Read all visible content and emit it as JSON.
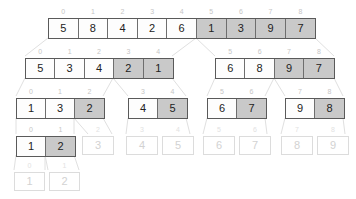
{
  "visualization": {
    "title": "merge-sort-recursion-tree",
    "colors": {
      "shaded_cell": "#c9c9c9",
      "plain_cell": "#fbfbfb",
      "border": "#5a5a5a",
      "faded_text": "#d2d2d2",
      "index_label": "#c6c6c6",
      "connector": "#e0e0e0"
    },
    "rows": [
      {
        "name": "level-0",
        "top": 18,
        "groups": [
          {
            "name": "group-0-8",
            "left": 48,
            "cell_width": 29.6,
            "faded": false,
            "cells": [
              {
                "index": "0",
                "value": "5",
                "shaded": false
              },
              {
                "index": "1",
                "value": "8",
                "shaded": false
              },
              {
                "index": "2",
                "value": "4",
                "shaded": false
              },
              {
                "index": "3",
                "value": "2",
                "shaded": false
              },
              {
                "index": "4",
                "value": "6",
                "shaded": false
              },
              {
                "index": "5",
                "value": "1",
                "shaded": true
              },
              {
                "index": "6",
                "value": "3",
                "shaded": true
              },
              {
                "index": "7",
                "value": "9",
                "shaded": true
              },
              {
                "index": "8",
                "value": "7",
                "shaded": true
              }
            ]
          }
        ]
      },
      {
        "name": "level-1",
        "top": 58,
        "groups": [
          {
            "name": "group-0-4",
            "left": 25,
            "cell_width": 29.4,
            "faded": false,
            "cells": [
              {
                "index": "0",
                "value": "5",
                "shaded": false
              },
              {
                "index": "1",
                "value": "3",
                "shaded": false
              },
              {
                "index": "2",
                "value": "4",
                "shaded": false
              },
              {
                "index": "3",
                "value": "2",
                "shaded": true
              },
              {
                "index": "4",
                "value": "1",
                "shaded": true
              }
            ]
          },
          {
            "name": "group-5-8",
            "left": 215,
            "cell_width": 29.4,
            "faded": false,
            "cells": [
              {
                "index": "5",
                "value": "6",
                "shaded": false
              },
              {
                "index": "6",
                "value": "8",
                "shaded": false
              },
              {
                "index": "7",
                "value": "9",
                "shaded": true
              },
              {
                "index": "8",
                "value": "7",
                "shaded": true
              }
            ]
          }
        ]
      },
      {
        "name": "level-2",
        "top": 98,
        "groups": [
          {
            "name": "group-0-2",
            "left": 16,
            "cell_width": 29,
            "faded": false,
            "cells": [
              {
                "index": "0",
                "value": "1",
                "shaded": false
              },
              {
                "index": "1",
                "value": "3",
                "shaded": false
              },
              {
                "index": "2",
                "value": "2",
                "shaded": true
              }
            ]
          },
          {
            "name": "group-3-4",
            "left": 128,
            "cell_width": 29,
            "faded": false,
            "cells": [
              {
                "index": "3",
                "value": "4",
                "shaded": false
              },
              {
                "index": "4",
                "value": "5",
                "shaded": true
              }
            ]
          },
          {
            "name": "group-5-6",
            "left": 207,
            "cell_width": 29,
            "faded": false,
            "cells": [
              {
                "index": "5",
                "value": "6",
                "shaded": false
              },
              {
                "index": "6",
                "value": "7",
                "shaded": true
              }
            ]
          },
          {
            "name": "group-7-8",
            "left": 285,
            "cell_width": 29,
            "faded": false,
            "cells": [
              {
                "index": "7",
                "value": "9",
                "shaded": false
              },
              {
                "index": "8",
                "value": "8",
                "shaded": true
              }
            ]
          }
        ]
      },
      {
        "name": "level-3",
        "top": 136,
        "groups": [
          {
            "name": "group-0-1",
            "left": 16,
            "cell_width": 29,
            "faded": false,
            "cells": [
              {
                "index": "0",
                "value": "1",
                "shaded": false
              },
              {
                "index": "1",
                "value": "2",
                "shaded": true
              }
            ]
          },
          {
            "name": "group-faded-2",
            "left": 82,
            "cell_width": 32,
            "faded": true,
            "cells": [
              {
                "index": "2",
                "value": "3",
                "shaded": false
              }
            ]
          },
          {
            "name": "group-faded-3",
            "left": 126,
            "cell_width": 32,
            "faded": true,
            "cells": [
              {
                "index": "3",
                "value": "4",
                "shaded": false
              },
              {
                "index": "4",
                "value": "5",
                "shaded": false
              }
            ]
          },
          {
            "name": "group-faded-5",
            "left": 203,
            "cell_width": 32,
            "faded": true,
            "cells": [
              {
                "index": "5",
                "value": "6",
                "shaded": false
              },
              {
                "index": "6",
                "value": "7",
                "shaded": false
              }
            ]
          },
          {
            "name": "group-faded-7",
            "left": 281,
            "cell_width": 32,
            "faded": true,
            "cells": [
              {
                "index": "7",
                "value": "8",
                "shaded": false
              },
              {
                "index": "8",
                "value": "9",
                "shaded": false
              }
            ]
          }
        ]
      },
      {
        "name": "level-4",
        "top": 172,
        "groups": [
          {
            "name": "group-faded-leaf",
            "left": 14,
            "cell_width": 31,
            "faded": true,
            "cells": [
              {
                "index": "0",
                "value": "1",
                "shaded": false
              },
              {
                "index": "1",
                "value": "2",
                "shaded": false
              }
            ]
          }
        ]
      }
    ],
    "connectors": [
      {
        "name": "edge-l0-left",
        "x1": 48,
        "y1": 38,
        "x2": 25,
        "y2": 56
      },
      {
        "name": "edge-l0-mid-left",
        "x1": 196,
        "y1": 38,
        "x2": 172,
        "y2": 56
      },
      {
        "name": "edge-l0-mid-right",
        "x1": 196,
        "y1": 38,
        "x2": 215,
        "y2": 56
      },
      {
        "name": "edge-l0-right",
        "x1": 315,
        "y1": 38,
        "x2": 334,
        "y2": 56
      },
      {
        "name": "edge-l1a-left",
        "x1": 25,
        "y1": 78,
        "x2": 16,
        "y2": 96
      },
      {
        "name": "edge-l1a-mid-l",
        "x1": 113,
        "y1": 78,
        "x2": 103,
        "y2": 96
      },
      {
        "name": "edge-l1a-mid-r",
        "x1": 113,
        "y1": 78,
        "x2": 128,
        "y2": 96
      },
      {
        "name": "edge-l1a-right",
        "x1": 172,
        "y1": 78,
        "x2": 186,
        "y2": 96
      },
      {
        "name": "edge-l1b-left",
        "x1": 215,
        "y1": 78,
        "x2": 207,
        "y2": 96
      },
      {
        "name": "edge-l1b-mid-l",
        "x1": 274,
        "y1": 78,
        "x2": 265,
        "y2": 96
      },
      {
        "name": "edge-l1b-mid-r",
        "x1": 274,
        "y1": 78,
        "x2": 285,
        "y2": 96
      },
      {
        "name": "edge-l1b-right",
        "x1": 334,
        "y1": 78,
        "x2": 343,
        "y2": 96
      },
      {
        "name": "edge-l2a-left",
        "x1": 16,
        "y1": 118,
        "x2": 16,
        "y2": 134
      },
      {
        "name": "edge-l2a-mid-l",
        "x1": 74,
        "y1": 118,
        "x2": 74,
        "y2": 134
      },
      {
        "name": "edge-l2a-mid-r",
        "x1": 74,
        "y1": 118,
        "x2": 88,
        "y2": 134
      },
      {
        "name": "edge-l2a-right",
        "x1": 103,
        "y1": 118,
        "x2": 112,
        "y2": 134
      },
      {
        "name": "edge-l2b-left",
        "x1": 128,
        "y1": 118,
        "x2": 126,
        "y2": 134
      },
      {
        "name": "edge-l2b-right",
        "x1": 186,
        "y1": 118,
        "x2": 190,
        "y2": 134
      },
      {
        "name": "edge-l2c-left",
        "x1": 207,
        "y1": 118,
        "x2": 203,
        "y2": 134
      },
      {
        "name": "edge-l2c-right",
        "x1": 265,
        "y1": 118,
        "x2": 267,
        "y2": 134
      },
      {
        "name": "edge-l2d-left",
        "x1": 285,
        "y1": 118,
        "x2": 281,
        "y2": 134
      },
      {
        "name": "edge-l2d-right",
        "x1": 343,
        "y1": 118,
        "x2": 345,
        "y2": 134
      },
      {
        "name": "edge-l3-left",
        "x1": 16,
        "y1": 155,
        "x2": 14,
        "y2": 170
      },
      {
        "name": "edge-l3-mid-l",
        "x1": 45,
        "y1": 155,
        "x2": 45,
        "y2": 170
      },
      {
        "name": "edge-l3-mid-r",
        "x1": 45,
        "y1": 155,
        "x2": 48,
        "y2": 170
      },
      {
        "name": "edge-l3-right",
        "x1": 74,
        "y1": 155,
        "x2": 79,
        "y2": 170
      }
    ]
  }
}
